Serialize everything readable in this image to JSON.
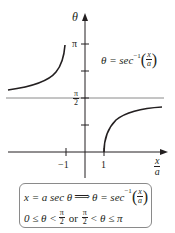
{
  "figure": {
    "axes": {
      "y_axis_label": "θ",
      "x_axis_label": {
        "numerator": "x",
        "denominator": "a"
      },
      "y_ticks": [
        {
          "label": "π",
          "value": "pi"
        },
        {
          "label": "",
          "value": "3pi/4"
        },
        {
          "label": {
            "numerator": "π",
            "denominator": "2"
          },
          "value": "pi/2"
        },
        {
          "label": "",
          "value": "pi/4"
        }
      ],
      "x_ticks": [
        {
          "label": "−1",
          "value": -1
        },
        {
          "label": "1",
          "value": 1
        }
      ]
    },
    "curve_label": {
      "lhs": "θ = sec",
      "exponent": "−1",
      "arg": {
        "numerator": "x",
        "denominator": "a"
      }
    },
    "asymptote": "θ = π/2",
    "colors": {
      "curve": "#231f20",
      "axes": "#231f20",
      "asymptote": "#8a8a8a",
      "box_border": "#8a8a8a"
    }
  },
  "formula_box": {
    "line1": {
      "part1": "x = a sec θ",
      "implies": "⟹",
      "part2": "θ = sec",
      "exponent": "−1",
      "arg": {
        "numerator": "x",
        "denominator": "a"
      }
    },
    "line2": {
      "part1": "0 ≤ θ <",
      "frac1": {
        "numerator": "π",
        "denominator": "2"
      },
      "or": "or",
      "frac2": {
        "numerator": "π",
        "denominator": "2"
      },
      "part2": "< θ ≤ π"
    }
  }
}
